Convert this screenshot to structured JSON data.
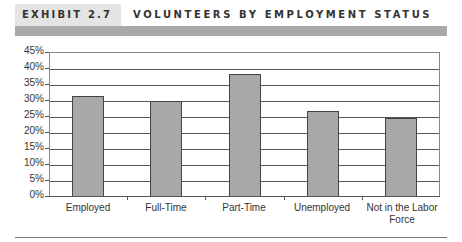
{
  "header": {
    "exhibit_label": "EXHIBIT 2.7",
    "title": "VOLUNTEERS BY EMPLOYMENT STATUS"
  },
  "colors": {
    "bar_fill": "#a8a8a8",
    "header_band": "#a9a9a9",
    "label_box": "#e4e4e4"
  },
  "chart_data": {
    "type": "bar",
    "title": "Volunteers by Employment Status",
    "categories": [
      "Employed",
      "Full-Time",
      "Part-Time",
      "Unemployed",
      "Not in the Labor Force"
    ],
    "values": [
      31.2,
      29.8,
      38.2,
      26.6,
      24.4
    ],
    "value_format": "percent",
    "xlabel": "",
    "ylabel": "",
    "ylim": [
      0,
      45
    ],
    "yticks": [
      "0%",
      "5%",
      "10%",
      "15%",
      "20%",
      "25%",
      "30%",
      "35%",
      "40%",
      "45%"
    ],
    "grid": true,
    "legend": null
  },
  "xlabels": {
    "c0": "Employed",
    "c1": "Full-Time",
    "c2": "Part-Time",
    "c3": "Unemployed",
    "c4a": "Not in the Labor",
    "c4b": "Force"
  }
}
